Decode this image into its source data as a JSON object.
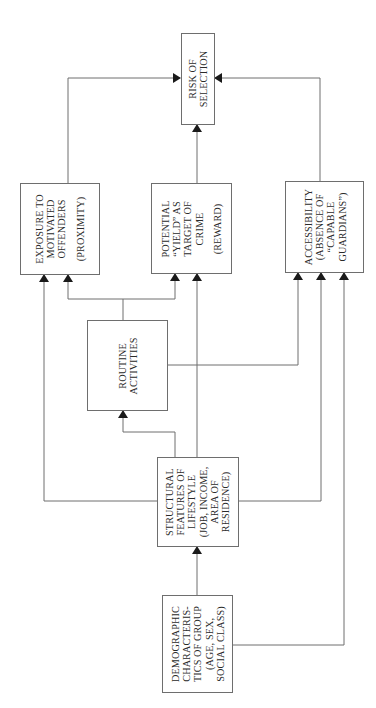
{
  "diagram": {
    "orientation": "rotated-90-ccw",
    "line_color": "#6e6e6e",
    "text_color": "#2a2a2a",
    "nodes": {
      "risk": {
        "lines": [
          "RISK OF",
          "SELECTION"
        ],
        "sub": []
      },
      "exposure": {
        "lines": [
          "EXPOSURE TO",
          "MOTIVATED",
          "OFFENDERS"
        ],
        "sub": [
          "(PROXIMITY)"
        ]
      },
      "yield": {
        "lines": [
          "POTENTIAL",
          "“YIELD” AS",
          "TARGET OF",
          "CRIME"
        ],
        "sub": [
          "(REWARD)"
        ]
      },
      "accessibility": {
        "lines": [
          "ACCESSIBILITY",
          "(ABSENCE OF",
          "“CAPABLE",
          "GUARDIANS”)"
        ],
        "sub": []
      },
      "routine": {
        "lines": [
          "ROUTINE",
          "ACTIVITIES"
        ],
        "sub": []
      },
      "structural": {
        "lines": [
          "STRUCTURAL",
          "FEATURES OF",
          "LIFESTYLE",
          "(JOB, INCOME,",
          "AREA OF",
          "RESIDENCE)"
        ],
        "sub": []
      },
      "demographic": {
        "lines": [
          "DEMOGRAPHIC",
          "CHARACTERIS-",
          "TICS OF GROUP",
          "(AGE, SEX,",
          "SOCIAL CLASS)"
        ],
        "sub": []
      }
    },
    "edges": [
      {
        "from": "exposure",
        "to": "risk"
      },
      {
        "from": "yield",
        "to": "risk"
      },
      {
        "from": "accessibility",
        "to": "risk"
      },
      {
        "from": "routine",
        "to": "exposure"
      },
      {
        "from": "routine",
        "to": "yield"
      },
      {
        "from": "routine",
        "to": "accessibility"
      },
      {
        "from": "structural",
        "to": "routine"
      },
      {
        "from": "structural",
        "to": "exposure"
      },
      {
        "from": "structural",
        "to": "yield"
      },
      {
        "from": "structural",
        "to": "accessibility"
      },
      {
        "from": "demographic",
        "to": "structural"
      },
      {
        "from": "demographic",
        "to": "accessibility"
      }
    ]
  }
}
